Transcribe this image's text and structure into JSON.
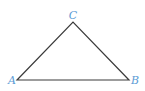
{
  "diagram": {
    "type": "triangle",
    "line_color": "#3a3a3a",
    "label_color": "#5b9bd5",
    "vertices": {
      "A": {
        "label": "A",
        "x": 17,
        "y": 80
      },
      "B": {
        "label": "B",
        "x": 129,
        "y": 80
      },
      "C": {
        "label": "C",
        "x": 73,
        "y": 22
      }
    },
    "labels": {
      "A": "A",
      "B": "B",
      "C": "C"
    }
  }
}
